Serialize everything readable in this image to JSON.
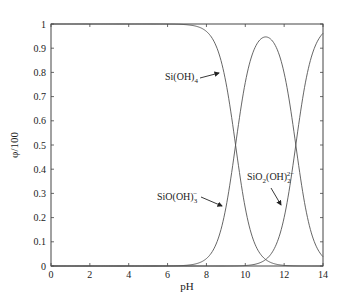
{
  "chart_data": {
    "type": "line",
    "title": "",
    "xlabel": "pH",
    "ylabel": "φ/100",
    "xlim": [
      0,
      14
    ],
    "ylim": [
      0,
      1
    ],
    "xticks": [
      0,
      2,
      4,
      6,
      8,
      10,
      12,
      14
    ],
    "yticks": [
      0,
      0.1,
      0.2,
      0.3,
      0.4,
      0.5,
      0.6,
      0.7,
      0.8,
      0.9,
      1
    ],
    "xtick_labels": [
      "0",
      "2",
      "4",
      "6",
      "8",
      "10",
      "12",
      "14"
    ],
    "ytick_labels": [
      "0",
      "0.1",
      "0.2",
      "0.3",
      "0.4",
      "0.5",
      "0.6",
      "0.7",
      "0.8",
      "0.9",
      "1"
    ],
    "grid": false,
    "legend": "inline annotations with arrows",
    "model": {
      "pKa1": 9.5,
      "pKa2": 12.6
    },
    "x": [
      0,
      2,
      4,
      6,
      7,
      8,
      8.5,
      9,
      9.5,
      10,
      10.5,
      11,
      11.5,
      12,
      12.5,
      13,
      13.5,
      14
    ],
    "series": [
      {
        "name": "Si(OH)4",
        "label_text": "Si(OH)",
        "label_sub": "4",
        "label_sup": "",
        "values": [
          1.0,
          1.0,
          1.0,
          1.0,
          0.997,
          0.969,
          0.909,
          0.76,
          0.5,
          0.24,
          0.091,
          0.031,
          0.009,
          0.002,
          0.0,
          0.0,
          0.0,
          0.0
        ]
      },
      {
        "name": "SiO(OH)3-",
        "label_text": "SiO(OH)",
        "label_sub": "3",
        "label_sup": "−",
        "values": [
          0.0,
          0.0,
          0.0,
          0.0,
          0.003,
          0.031,
          0.091,
          0.24,
          0.499,
          0.757,
          0.9,
          0.952,
          0.919,
          0.799,
          0.556,
          0.284,
          0.111,
          0.038
        ]
      },
      {
        "name": "SiO2(OH)2 2-",
        "label_text": "SiO",
        "label_sub": "2",
        "label_text2": "(OH)",
        "label_sub2": "2",
        "label_sup": "2−",
        "values": [
          0.0,
          0.0,
          0.0,
          0.0,
          0.0,
          0.0,
          0.0,
          0.0,
          0.001,
          0.003,
          0.009,
          0.015,
          0.073,
          0.201,
          0.443,
          0.715,
          0.889,
          0.962
        ]
      }
    ],
    "annotations": [
      {
        "series": "Si(OH)4",
        "text_x": 165,
        "text_y": 80,
        "arrow_from": [
          200,
          78
        ],
        "arrow_to": [
          219,
          73
        ]
      },
      {
        "series": "SiO(OH)3-",
        "text_x": 157,
        "text_y": 200,
        "arrow_from": [
          201,
          197
        ],
        "arrow_to": [
          222,
          206
        ]
      },
      {
        "series": "SiO2(OH)2 2-",
        "text_x": 247,
        "text_y": 180,
        "arrow_from": [
          271,
          188
        ],
        "arrow_to": [
          281,
          205
        ]
      }
    ],
    "colors": {
      "curve": "#555555",
      "frame": "#444444",
      "text": "#222222"
    }
  }
}
